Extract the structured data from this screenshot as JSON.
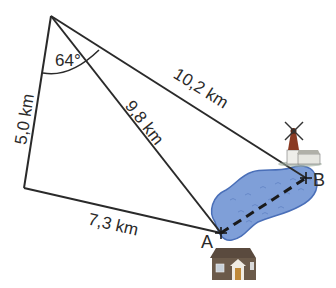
{
  "diagram": {
    "points": {
      "A": "A",
      "B": "B"
    },
    "labels": {
      "left_side": "5,0 km",
      "bottom_side": "7,3 km",
      "diagonal": "9,8 km",
      "top_side": "10,2 km",
      "angle": "64°"
    },
    "icons": {
      "lake": "lake-icon",
      "windmill": "windmill-icon",
      "house": "house-icon"
    },
    "colors": {
      "line": "#2a2a2a",
      "lake_fill": "#7f9fd8",
      "lake_stroke": "#4a6fb8",
      "house_wall": "#6b5a4a",
      "windmill_body": "#8a3a22"
    }
  }
}
